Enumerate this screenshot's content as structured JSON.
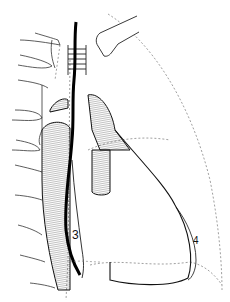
{
  "figure": {
    "type": "anatomical line drawing",
    "labels": [
      {
        "id": "3",
        "text": "3"
      },
      {
        "id": "4",
        "text": "4"
      }
    ],
    "colors": {
      "line": "#111111",
      "background": "#ffffff",
      "dashed": "#777777"
    }
  }
}
